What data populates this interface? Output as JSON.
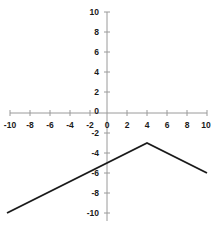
{
  "chart_data": {
    "type": "line",
    "title": "",
    "xlabel": "",
    "ylabel": "",
    "xlim": [
      -10,
      10
    ],
    "ylim": [
      -10,
      10
    ],
    "grid": false,
    "legend": "none",
    "x_ticks": [
      -10,
      -8,
      -6,
      -4,
      -2,
      0,
      2,
      4,
      6,
      8,
      10
    ],
    "y_ticks": [
      10,
      8,
      6,
      4,
      2,
      0,
      -2,
      -4,
      -6,
      -8,
      -10
    ],
    "x_tick_labels": [
      "-10",
      "-8",
      "-6",
      "-4",
      "-2",
      "0",
      "2",
      "4",
      "6",
      "8",
      "10"
    ],
    "y_tick_labels": [
      "10",
      "8",
      "6",
      "4",
      "2",
      "0",
      "-2",
      "-4",
      "-6",
      "-8",
      "-10"
    ],
    "series": [
      {
        "name": "piecewise-linear",
        "color": "#1a1a1a",
        "x": [
          -10,
          4,
          10
        ],
        "y": [
          -10,
          -3,
          -6
        ],
        "points": [
          {
            "x": -10,
            "y": -10
          },
          {
            "x": 4,
            "y": -3
          },
          {
            "x": 10,
            "y": -6
          }
        ],
        "vertex": {
          "x": 4,
          "y": -3
        },
        "y_intercept": -5
      }
    ],
    "axis_color": "#999999",
    "line_color": "#1a1a1a",
    "background_color": "#ffffff"
  },
  "axes": {
    "x_axis_name": "x-axis",
    "y_axis_name": "y-axis",
    "origin_label": "0"
  }
}
